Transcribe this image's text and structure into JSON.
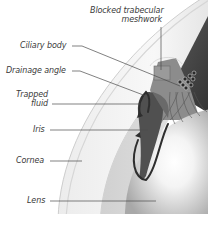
{
  "diagram": {
    "labels": {
      "blocked_trabecular": "Blocked trabecular",
      "meshwork": "meshwork",
      "ciliary_body": "Ciliary body",
      "drainage_angle": "Drainage angle",
      "trapped": "Trapped",
      "fluid": "fluid",
      "iris": "Iris",
      "cornea": "Cornea",
      "lens": "Lens"
    },
    "colors": {
      "label_text": "#3a3a3a",
      "leader_line": "#4a4a4a",
      "iris": "#5a5a5a",
      "ciliary_dark": "#3c3c3c",
      "fluid_arrow": "#2e2e2e",
      "cornea_light": "#f2f2f2",
      "lens_glow": "#ffffff"
    }
  }
}
